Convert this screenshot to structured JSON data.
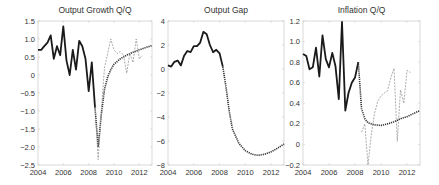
{
  "figure": {
    "background": "#ffffff",
    "axis_color": "#cfcfcf",
    "line_color_actual": "#1a1a1a",
    "line_color_forecast": "#333333",
    "line_color_alt": "#888888"
  },
  "chart_data": [
    {
      "type": "line",
      "title": "Output Growth Q/Q",
      "xlabel": "",
      "ylabel": "",
      "xlim": [
        2004,
        2013
      ],
      "ylim": [
        -2.5,
        1.5
      ],
      "xticks": [
        "2004",
        "2006",
        "2008",
        "2010",
        "2012"
      ],
      "yticks": [
        "1.5",
        "1.0",
        "0.5",
        "0",
        "-0.5",
        "-1.0",
        "-1.5",
        "-2.0",
        "-2.5"
      ],
      "grid": false,
      "series": [
        {
          "name": "Actual",
          "style": "solid-thick",
          "x": [
            2004.0,
            2004.25,
            2004.5,
            2004.75,
            2005.0,
            2005.25,
            2005.5,
            2005.75,
            2006.0,
            2006.25,
            2006.5,
            2006.75,
            2007.0,
            2007.25,
            2007.5,
            2007.75,
            2008.0,
            2008.25,
            2008.5
          ],
          "values": [
            0.7,
            0.7,
            0.8,
            0.9,
            1.1,
            0.45,
            0.8,
            0.55,
            1.35,
            0.4,
            0.0,
            0.7,
            0.15,
            0.95,
            0.8,
            0.45,
            -0.45,
            0.35,
            -0.9
          ]
        },
        {
          "name": "Model forecast",
          "style": "dotted-thick",
          "x": [
            2008.5,
            2008.75,
            2009.0,
            2009.25,
            2009.5,
            2009.75,
            2010.0,
            2010.5,
            2011.0,
            2011.5,
            2012.0,
            2012.5,
            2013.0
          ],
          "values": [
            -0.9,
            -2.0,
            -1.1,
            -0.4,
            -0.05,
            0.15,
            0.3,
            0.45,
            0.55,
            0.63,
            0.7,
            0.76,
            0.82
          ]
        },
        {
          "name": "Realized",
          "style": "dashed-thin",
          "x": [
            2008.5,
            2008.75,
            2009.0,
            2009.25,
            2009.5,
            2009.75,
            2010.0,
            2010.25,
            2010.5,
            2010.75,
            2011.0,
            2011.25,
            2011.5,
            2011.75,
            2012.0,
            2012.25
          ],
          "values": [
            -0.9,
            -2.35,
            -1.0,
            0.2,
            0.6,
            1.0,
            0.7,
            0.6,
            0.65,
            0.55,
            0.05,
            0.6,
            0.35,
            1.0,
            0.45,
            0.55
          ]
        }
      ]
    },
    {
      "type": "line",
      "title": "Output Gap",
      "xlabel": "",
      "ylabel": "",
      "xlim": [
        2004,
        2013
      ],
      "ylim": [
        -8,
        4
      ],
      "xticks": [
        "2004",
        "2006",
        "2008",
        "2010",
        "2012"
      ],
      "yticks": [
        "4",
        "2",
        "0",
        "-2",
        "-4",
        "-6",
        "-8"
      ],
      "grid": false,
      "series": [
        {
          "name": "Actual",
          "style": "solid-thick",
          "x": [
            2004.0,
            2004.25,
            2004.5,
            2004.75,
            2005.0,
            2005.25,
            2005.5,
            2005.75,
            2006.0,
            2006.25,
            2006.5,
            2006.75,
            2007.0,
            2007.25,
            2007.5,
            2007.75,
            2008.0,
            2008.25
          ],
          "values": [
            0.3,
            0.2,
            0.6,
            0.7,
            0.3,
            1.1,
            1.5,
            1.4,
            1.9,
            1.9,
            2.2,
            3.1,
            2.9,
            2.0,
            1.4,
            1.6,
            1.3,
            0.2
          ]
        },
        {
          "name": "Model forecast",
          "style": "dotted-thick",
          "x": [
            2008.25,
            2008.5,
            2008.75,
            2009.0,
            2009.5,
            2010.0,
            2010.5,
            2011.0,
            2011.5,
            2012.0,
            2012.5,
            2013.0
          ],
          "values": [
            0.2,
            -1.5,
            -3.5,
            -5.0,
            -6.2,
            -6.8,
            -7.1,
            -7.2,
            -7.1,
            -6.9,
            -6.6,
            -6.25
          ]
        }
      ]
    },
    {
      "type": "line",
      "title": "Inflation Q/Q",
      "xlabel": "",
      "ylabel": "",
      "xlim": [
        2004,
        2013
      ],
      "ylim": [
        -0.2,
        1.2
      ],
      "xticks": [
        "2004",
        "2006",
        "2008",
        "2010",
        "2012"
      ],
      "yticks": [
        "1.2",
        "1.0",
        "0.8",
        "0.6",
        "0.4",
        "0.2",
        "0",
        "-0.2"
      ],
      "grid": false,
      "series": [
        {
          "name": "Actual",
          "style": "solid-thick",
          "x": [
            2004.0,
            2004.25,
            2004.5,
            2004.75,
            2005.0,
            2005.25,
            2005.5,
            2005.75,
            2006.0,
            2006.25,
            2006.5,
            2006.75,
            2007.0,
            2007.25,
            2007.5,
            2007.75,
            2008.0,
            2008.25
          ],
          "values": [
            0.88,
            0.86,
            0.73,
            0.75,
            0.94,
            0.66,
            1.06,
            0.83,
            0.75,
            0.89,
            0.76,
            0.44,
            1.19,
            0.33,
            0.5,
            0.6,
            0.65,
            0.8
          ]
        },
        {
          "name": "Model forecast",
          "style": "dotted-thick",
          "x": [
            2008.25,
            2008.5,
            2008.75,
            2009.0,
            2009.5,
            2010.0,
            2010.5,
            2011.0,
            2011.5,
            2012.0,
            2012.5,
            2013.0
          ],
          "values": [
            0.8,
            0.35,
            0.25,
            0.21,
            0.19,
            0.185,
            0.2,
            0.22,
            0.25,
            0.27,
            0.3,
            0.33
          ]
        },
        {
          "name": "Realized",
          "style": "dashed-thin",
          "x": [
            2008.5,
            2008.75,
            2009.0,
            2009.25,
            2009.5,
            2009.75,
            2010.0,
            2010.25,
            2010.5,
            2010.75,
            2011.0,
            2011.25,
            2011.5,
            2011.75,
            2012.0,
            2012.25
          ],
          "values": [
            0.12,
            0.2,
            -0.2,
            0.1,
            0.3,
            0.42,
            0.47,
            0.5,
            0.52,
            0.65,
            0.74,
            0.03,
            0.53,
            0.4,
            0.72,
            0.7
          ]
        }
      ]
    }
  ]
}
